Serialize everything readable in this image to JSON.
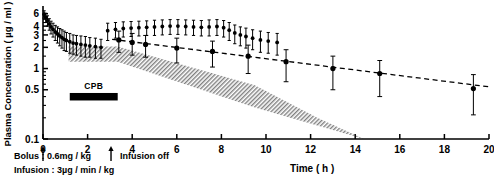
{
  "figure": {
    "name": "plasma-concentration-time-curve",
    "ylabel": "Plasma Concentration ( µg / ml )",
    "xlabel": "Time ( h )"
  },
  "annotations": {
    "cpb_bar_label": "CPB",
    "bolus_note": "Bolus : 0.6mg / kg",
    "infusion_note": "Infusion : 3µg / min / kg",
    "infusion_off_note": "Infusion off"
  },
  "chart_data": {
    "type": "scatter",
    "title": "",
    "xlabel": "Time ( h )",
    "ylabel": "Plasma Concentration ( µg / ml )",
    "xlim": [
      0,
      20
    ],
    "ylim": [
      0.1,
      7
    ],
    "yscale": "log",
    "xscale": "linear",
    "grid": false,
    "legend": null,
    "xticks": [
      0,
      2,
      4,
      6,
      8,
      10,
      12,
      14,
      16,
      18,
      20
    ],
    "xticklabels": [
      "0",
      "2",
      "4",
      "6",
      "8",
      "10",
      "12",
      "14",
      "16",
      "18",
      "20"
    ],
    "yticks": [
      0.1,
      0.5,
      1,
      2,
      3,
      4,
      6
    ],
    "yticklabels": [
      "0.1",
      "0.5",
      "1",
      "2",
      "3",
      "4",
      "6"
    ],
    "y_minor_ticks": [
      0.2,
      0.3,
      0.4,
      0.6,
      0.7,
      0.8,
      0.9,
      1.5,
      2.5,
      3.5,
      4.5,
      5,
      5.5
    ],
    "series": [
      {
        "name": "mean plasma concentration",
        "marker": "filled-circle",
        "errorbars": "sd",
        "points": [
          {
            "x": 0.05,
            "y": 5.9,
            "err": 0.7
          },
          {
            "x": 0.12,
            "y": 5.3,
            "err": 0.8
          },
          {
            "x": 0.2,
            "y": 4.8,
            "err": 0.8
          },
          {
            "x": 0.28,
            "y": 4.3,
            "err": 0.8
          },
          {
            "x": 0.36,
            "y": 3.9,
            "err": 0.8
          },
          {
            "x": 0.45,
            "y": 3.6,
            "err": 0.8
          },
          {
            "x": 0.55,
            "y": 3.3,
            "err": 0.8
          },
          {
            "x": 0.65,
            "y": 3.1,
            "err": 0.8
          },
          {
            "x": 0.75,
            "y": 2.9,
            "err": 0.8
          },
          {
            "x": 0.85,
            "y": 2.75,
            "err": 0.8
          },
          {
            "x": 0.95,
            "y": 2.6,
            "err": 0.8
          },
          {
            "x": 1.05,
            "y": 2.5,
            "err": 0.75
          },
          {
            "x": 1.2,
            "y": 2.4,
            "err": 0.75
          },
          {
            "x": 1.35,
            "y": 2.3,
            "err": 0.7
          },
          {
            "x": 1.5,
            "y": 2.25,
            "err": 0.7
          },
          {
            "x": 1.7,
            "y": 2.2,
            "err": 0.7
          },
          {
            "x": 1.9,
            "y": 2.15,
            "err": 0.7
          },
          {
            "x": 2.1,
            "y": 2.1,
            "err": 0.65
          },
          {
            "x": 2.35,
            "y": 2.05,
            "err": 0.65
          },
          {
            "x": 2.6,
            "y": 2.0,
            "err": 0.6
          },
          {
            "x": 2.9,
            "y": 3.45,
            "err": 0.95
          },
          {
            "x": 3.25,
            "y": 3.6,
            "err": 0.9
          },
          {
            "x": 3.6,
            "y": 3.7,
            "err": 0.9
          },
          {
            "x": 3.95,
            "y": 3.75,
            "err": 0.9
          },
          {
            "x": 4.3,
            "y": 3.8,
            "err": 0.9
          },
          {
            "x": 4.65,
            "y": 3.85,
            "err": 0.9
          },
          {
            "x": 5.0,
            "y": 3.9,
            "err": 0.95
          },
          {
            "x": 5.35,
            "y": 3.95,
            "err": 0.95
          },
          {
            "x": 5.7,
            "y": 4.0,
            "err": 0.95
          },
          {
            "x": 6.05,
            "y": 4.0,
            "err": 0.95
          },
          {
            "x": 6.4,
            "y": 3.95,
            "err": 0.95
          },
          {
            "x": 6.75,
            "y": 3.9,
            "err": 0.95
          },
          {
            "x": 7.1,
            "y": 3.85,
            "err": 0.95
          },
          {
            "x": 7.45,
            "y": 3.9,
            "err": 1.0
          },
          {
            "x": 7.8,
            "y": 3.95,
            "err": 1.0
          },
          {
            "x": 8.1,
            "y": 3.8,
            "err": 1.0
          },
          {
            "x": 8.35,
            "y": 3.5,
            "err": 1.0
          },
          {
            "x": 8.6,
            "y": 3.2,
            "err": 0.95
          },
          {
            "x": 8.85,
            "y": 3.0,
            "err": 0.9
          },
          {
            "x": 9.1,
            "y": 2.85,
            "err": 0.9
          },
          {
            "x": 9.4,
            "y": 2.7,
            "err": 0.85
          },
          {
            "x": 9.75,
            "y": 2.55,
            "err": 0.85
          },
          {
            "x": 10.1,
            "y": 2.45,
            "err": 0.8
          },
          {
            "x": 10.5,
            "y": 2.35,
            "err": 0.8
          }
        ]
      },
      {
        "name": "post-infusion sampled means",
        "marker": "filled-circle",
        "errorbars": "sd",
        "points": [
          {
            "x": 3.4,
            "y": 2.55,
            "err": 0.85
          },
          {
            "x": 4.0,
            "y": 2.35,
            "err": 0.8
          },
          {
            "x": 4.6,
            "y": 2.2,
            "err": 0.75
          },
          {
            "x": 6.0,
            "y": 1.95,
            "err": 0.75
          },
          {
            "x": 7.6,
            "y": 1.75,
            "err": 0.7
          },
          {
            "x": 9.2,
            "y": 1.5,
            "err": 0.65
          },
          {
            "x": 10.9,
            "y": 1.25,
            "err": 0.6
          },
          {
            "x": 13.0,
            "y": 1.0,
            "err": 0.5
          },
          {
            "x": 15.1,
            "y": 0.85,
            "err": 0.45
          },
          {
            "x": 19.3,
            "y": 0.52,
            "err": 0.3
          }
        ]
      }
    ],
    "fit_line": {
      "name": "terminal elimination regression",
      "style": "dashed",
      "x": [
        3.1,
        20.0
      ],
      "y": [
        2.6,
        0.55
      ]
    },
    "shaded_band": {
      "name": "therapeutic range band",
      "pattern": "hatched",
      "upper": [
        {
          "x": 1.15,
          "y": 2.05
        },
        {
          "x": 3.35,
          "y": 2.05
        },
        {
          "x": 9.5,
          "y": 0.58
        },
        {
          "x": 12.3,
          "y": 0.2
        }
      ],
      "lower": [
        {
          "x": 1.15,
          "y": 1.25
        },
        {
          "x": 3.35,
          "y": 1.25
        },
        {
          "x": 9.5,
          "y": 0.28
        },
        {
          "x": 14.4,
          "y": 0.1
        }
      ]
    },
    "event_markers": [
      {
        "label": "bolus",
        "x": 0.0
      },
      {
        "label": "infusion off",
        "x": 3.05
      }
    ],
    "cpb_bar": {
      "label": "CPB",
      "x_start": 1.2,
      "x_end": 3.35,
      "y": 0.45
    }
  }
}
